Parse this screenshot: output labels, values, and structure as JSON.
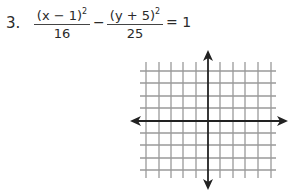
{
  "problem": {
    "number": "3.",
    "term1": {
      "numerator_base": "(x − 1)",
      "numerator_exp": "2",
      "denominator": "16"
    },
    "operator": "−",
    "term2": {
      "numerator_base": "(y + 5)",
      "numerator_exp": "2",
      "denominator": "25"
    },
    "equals": "= 1"
  },
  "graph": {
    "type": "coordinate-grid",
    "grid_lines_per_side": 5,
    "axis_arrows": [
      "up",
      "down",
      "left",
      "right"
    ],
    "grid_color": "#9a9a9a",
    "axis_color": "#222222"
  }
}
